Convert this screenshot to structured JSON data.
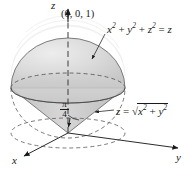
{
  "figure": {
    "axes": {
      "z_label": "z",
      "y_label": "y",
      "x_label": "x"
    },
    "annotations": {
      "apex_point": "(0, 0, 1)",
      "sphere_equation_parts": {
        "x": "x",
        "exp2_a": "2",
        "plus1": "+",
        "y": "y",
        "exp2_b": "2",
        "plus2": "+",
        "z": "z",
        "exp2_c": "2",
        "equals": "=",
        "rhs": "z"
      },
      "sphere_equation_text": "x² + y² + z² = z",
      "cone_equation_parts": {
        "z": "z",
        "equals": "=",
        "radical": "√",
        "x": "x",
        "exp2_a": "2",
        "plus": "+",
        "y": "y",
        "exp2_b": "2"
      },
      "cone_equation_text": "z = √(x² + y²)",
      "angle_numerator": "π",
      "angle_denominator": "4",
      "angle_text": "π/4"
    },
    "colors": {
      "ink": "#1a1a1a",
      "sphere_fill": "#d9d9d9",
      "sphere_fill_light": "#e8e8e8",
      "cone_fill": "#c9c9c9",
      "outline": "#4a4a4a",
      "dashed": "#5a5a5a",
      "background": "#ffffff"
    },
    "geometry": {
      "origin_x": 68,
      "origin_y": 133,
      "sphere_center_x": 68,
      "sphere_center_y": 68,
      "sphere_radius_x": 57,
      "sphere_radius_y": 50,
      "equator_rx": 57,
      "equator_ry": 15,
      "equator_cy": 88,
      "cone_apex_x": 68,
      "cone_apex_y": 133,
      "z_axis_top_y": 8,
      "y_axis_end_x": 180,
      "y_axis_end_y": 147,
      "x_axis_end_x": 22,
      "x_axis_end_y": 157
    }
  }
}
